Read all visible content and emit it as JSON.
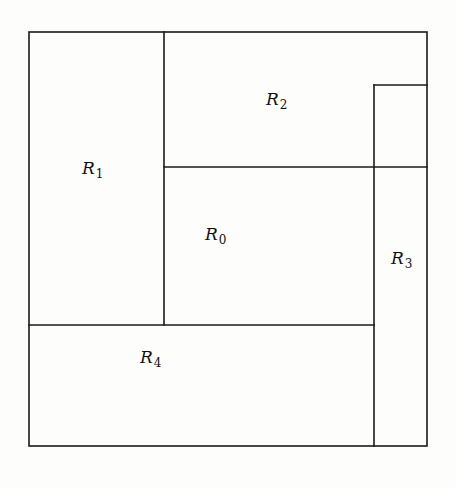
{
  "diagram": {
    "type": "rectangle-partition",
    "regions": [
      {
        "id": "R0",
        "base": "R",
        "sub": "0",
        "label_pos": [
          205,
          226
        ]
      },
      {
        "id": "R1",
        "base": "R",
        "sub": "1",
        "label_pos": [
          82,
          160
        ]
      },
      {
        "id": "R2",
        "base": "R",
        "sub": "2",
        "label_pos": [
          266,
          91
        ]
      },
      {
        "id": "R3",
        "base": "R",
        "sub": "3",
        "label_pos": [
          391,
          250
        ]
      },
      {
        "id": "R4",
        "base": "R",
        "sub": "4",
        "label_pos": [
          140,
          349
        ]
      }
    ],
    "line_color": "#1a1a1a",
    "background": "#fdfdfb"
  }
}
